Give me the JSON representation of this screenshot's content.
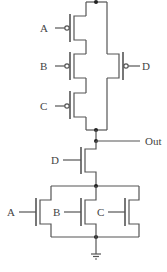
{
  "diagram": {
    "type": "CMOS complex gate schematic",
    "labels": {
      "a_top": "A",
      "b_top": "B",
      "c_top": "C",
      "d_top": "D",
      "out": "Out",
      "d_bottom": "D",
      "a_bottom": "A",
      "b_bottom": "B",
      "c_bottom": "C"
    },
    "colors": {
      "wire": "#555555",
      "node": "#222222",
      "text": "#444444"
    }
  }
}
